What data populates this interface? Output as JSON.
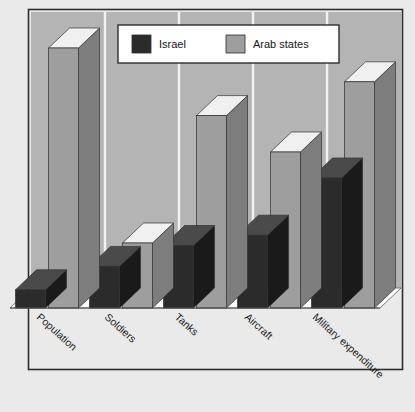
{
  "chart_data": {
    "type": "bar",
    "title": "",
    "subtitle": "",
    "xlabel": "",
    "ylabel": "",
    "grid": true,
    "grid_orientation": "vertical-category-separators",
    "projection": "3d",
    "legend_position": "top-center",
    "ylim": [
      0,
      100
    ],
    "axis_ticks": [],
    "categories": [
      "Population",
      "Soldiers",
      "Tanks",
      "Aircraft",
      "Military expenditure"
    ],
    "series": [
      {
        "name": "Israel",
        "color": "#2b2b2b",
        "values": [
          7,
          16,
          24,
          28,
          50
        ]
      },
      {
        "name": "Arab states",
        "color": "#9e9e9e",
        "values": [
          100,
          25,
          74,
          60,
          87
        ]
      }
    ],
    "annotations": []
  },
  "legend": {
    "items": [
      {
        "label": "Israel",
        "swatch": "#2b2b2b"
      },
      {
        "label": "Arab states",
        "swatch": "#9e9e9e"
      }
    ]
  },
  "axis": {
    "category_labels": [
      "Population",
      "Soldiers",
      "Tanks",
      "Aircraft",
      "Military expenditure"
    ]
  },
  "colors": {
    "page_background": "#eaeaea",
    "frame_border": "#2d2d2d",
    "plot_wall": "#b4b4b4",
    "floor": "#ffffff",
    "gridline": "#f2f2f2",
    "israel_front": "#2b2b2b",
    "israel_side": "#1a1a1a",
    "israel_top": "#4a4a4a",
    "arab_front": "#9e9e9e",
    "arab_side": "#7d7d7d",
    "arab_top": "#f0f0f0",
    "legend_background": "#ffffff"
  }
}
